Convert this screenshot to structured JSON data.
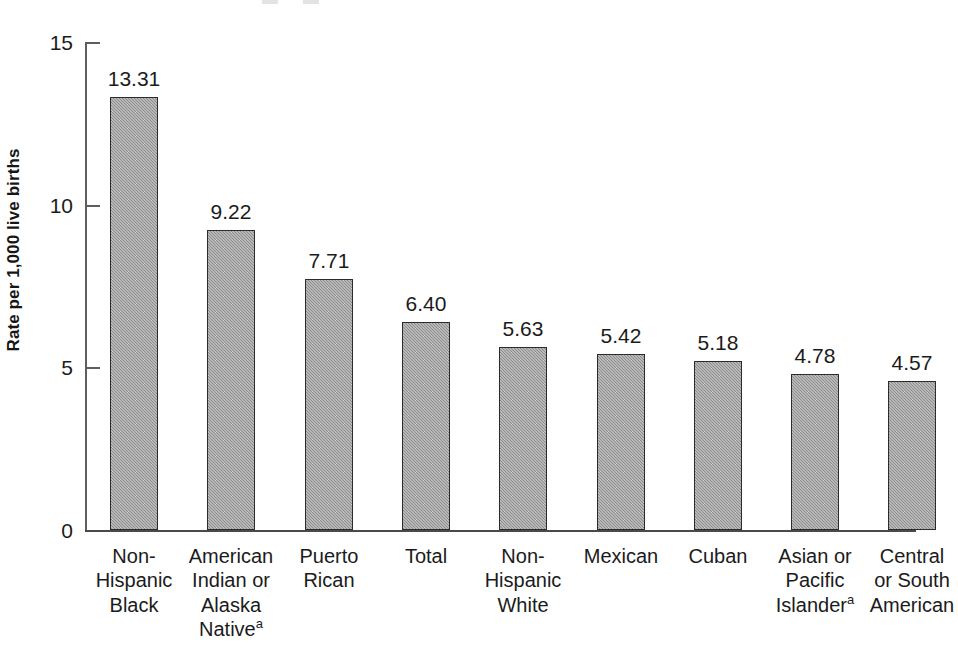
{
  "chart_data": {
    "type": "bar",
    "title": "",
    "xlabel": "",
    "ylabel": "Rate per 1,000 live births",
    "ylim": [
      0,
      15
    ],
    "yticks": [
      0,
      5,
      10,
      15
    ],
    "ytick_labels": [
      "0",
      "5",
      "10",
      "15"
    ],
    "grid": false,
    "legend": null,
    "bar_color": "#9a9a9a",
    "bar_edge_color": "#2b2b2b",
    "axis_color": "#5e5e5e",
    "categories": [
      "Non-Hispanic Black",
      "American Indian or Alaska Native",
      "Puerto Rican",
      "Total",
      "Non-Hispanic White",
      "Mexican",
      "Cuban",
      "Asian or Pacific Islander",
      "Central or South American"
    ],
    "values": [
      13.31,
      9.22,
      7.71,
      6.4,
      5.63,
      5.42,
      5.18,
      4.78,
      4.57
    ],
    "value_labels": [
      "13.31",
      "9.22",
      "7.71",
      "6.40",
      "5.63",
      "5.42",
      "5.18",
      "4.78",
      "4.57"
    ],
    "category_label_lines": [
      [
        "Non-",
        "Hispanic",
        "Black"
      ],
      [
        "American",
        "Indian or",
        "Alaska",
        "Native"
      ],
      [
        "Puerto",
        "Rican"
      ],
      [
        "Total"
      ],
      [
        "Non-",
        "Hispanic",
        "White"
      ],
      [
        "Mexican"
      ],
      [
        "Cuban"
      ],
      [
        "Asian or",
        "Pacific",
        "Islander"
      ],
      [
        "Central",
        "or South",
        "American"
      ]
    ],
    "footnote_markers": {
      "1": "a",
      "7": "a"
    },
    "footnote_marker_symbol": "a"
  }
}
